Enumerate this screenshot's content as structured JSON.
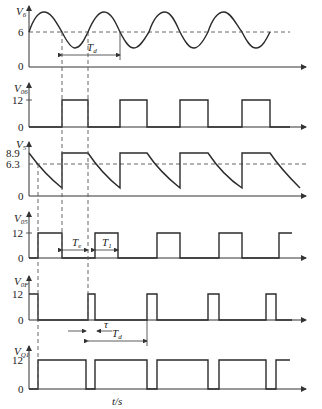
{
  "diagram": {
    "title": "",
    "x_axis_label": "t/s",
    "panels": [
      {
        "id": "v6",
        "y_label": "V",
        "y_sub": "6",
        "ticks": [
          "6",
          "0"
        ],
        "signal": "sinusoid around 6 V"
      },
      {
        "id": "v06",
        "y_label": "V",
        "y_sub": "06",
        "ticks": [
          "12",
          "0"
        ],
        "signal": "square pulses 0/12 V"
      },
      {
        "id": "v5",
        "y_label": "V",
        "y_sub": "5",
        "ticks": [
          "8.9",
          "6.3",
          "0"
        ],
        "signal": "sawtooth-like capacitor charge/discharge"
      },
      {
        "id": "v05",
        "y_label": "V",
        "y_sub": "05",
        "ticks": [
          "12",
          "0"
        ],
        "signal": "square pulses with Te and T1"
      },
      {
        "id": "v0f",
        "y_label": "V",
        "y_sub": "0F",
        "ticks": [
          "12",
          "0"
        ],
        "signal": "narrow pulses of width tau"
      },
      {
        "id": "vq1",
        "y_label": "V",
        "y_sub": "Q1",
        "ticks": [
          "12",
          "0"
        ],
        "signal": "inverted narrow pulses"
      }
    ],
    "annotations": {
      "td_top": "T",
      "td_top_sub": "d",
      "te": "T",
      "te_sub": "e",
      "t1": "T",
      "t1_sub": "1",
      "tau": "τ",
      "td_bottom": "T",
      "td_bottom_sub": "d"
    }
  }
}
